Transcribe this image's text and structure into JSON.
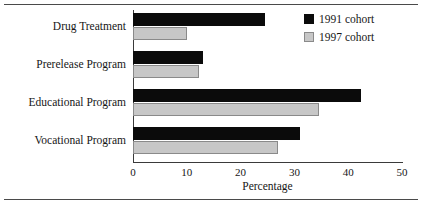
{
  "chart_data": {
    "type": "bar",
    "orientation": "horizontal",
    "title": "",
    "xlabel": "Percentage",
    "ylabel": "",
    "xlim": [
      0,
      50
    ],
    "xticks": [
      0,
      10,
      20,
      30,
      40,
      50
    ],
    "grid": false,
    "legend_position": "top-right",
    "categories": [
      "Drug Treatment",
      "Prerelease Program",
      "Educational Program",
      "Vocational Program"
    ],
    "series": [
      {
        "name": "1991 cohort",
        "color": "#0b0b0b",
        "values": [
          24.5,
          13.0,
          42.4,
          31.0
        ]
      },
      {
        "name": "1997 cohort",
        "color": "#c7c7c7",
        "values": [
          10.0,
          12.3,
          34.6,
          27.0
        ]
      }
    ]
  },
  "legend": {
    "entries": [
      {
        "label": "1991 cohort"
      },
      {
        "label": "1997 cohort"
      }
    ]
  },
  "axis": {
    "x_title": "Percentage",
    "tick_labels": [
      "0",
      "10",
      "20",
      "30",
      "40",
      "50"
    ]
  }
}
